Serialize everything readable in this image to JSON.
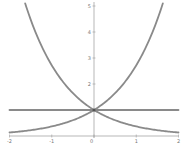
{
  "chart_data": {
    "type": "line",
    "title": "",
    "xlabel": "",
    "ylabel": "",
    "xlim": [
      -2,
      2
    ],
    "ylim": [
      0,
      5
    ],
    "grid": false,
    "legend": null,
    "x_ticks": [
      "-2",
      "-1",
      "0",
      "1",
      "2"
    ],
    "y_ticks": [
      "2",
      "3",
      "4",
      "5"
    ],
    "series": [
      {
        "name": "y = e^x",
        "function": "exp(x)",
        "x": [
          -2,
          -1.5,
          -1,
          -0.5,
          0,
          0.5,
          1,
          1.5,
          1.63
        ],
        "values": [
          0.14,
          0.22,
          0.37,
          0.61,
          1.0,
          1.65,
          2.72,
          4.48,
          5.1
        ]
      },
      {
        "name": "y = e^-x",
        "function": "exp(-x)",
        "x": [
          -1.63,
          -1.5,
          -1,
          -0.5,
          0,
          0.5,
          1,
          1.5,
          2
        ],
        "values": [
          5.1,
          4.48,
          2.72,
          1.65,
          1.0,
          0.61,
          0.37,
          0.22,
          0.14
        ]
      },
      {
        "name": "y = 1",
        "function": "1",
        "x": [
          -2,
          2
        ],
        "values": [
          1,
          1
        ]
      }
    ],
    "colors": {
      "curve": "#8a8a8a",
      "axis": "#9a9a9a",
      "label": "#777777"
    }
  }
}
